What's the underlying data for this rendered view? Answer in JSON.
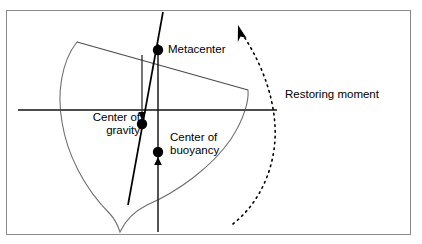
{
  "figure": {
    "frame": {
      "stroke": "#808080"
    },
    "colors": {
      "outline": "#6e6e6e",
      "line": "#000000",
      "waterline": "#4d4d4d",
      "dot": "#000000",
      "dashed_arc": "#000000",
      "text": "#000000",
      "background": "#ffffff"
    },
    "labels": {
      "metacenter": "Metacenter",
      "center_of_gravity_line1": "Center of",
      "center_of_gravity_line2": "gravity",
      "center_of_buoyancy_line1": "Center of",
      "center_of_buoyancy_line2": "buoyancy",
      "restoring_moment": "Restoring moment"
    },
    "points": [
      {
        "name": "metacenter",
        "x": 158,
        "y": 50,
        "r": 5.2
      },
      {
        "name": "center-of-gravity",
        "x": 142,
        "y": 124,
        "r": 5.2
      },
      {
        "name": "center-of-buoyancy",
        "x": 158,
        "y": 152,
        "r": 5.2
      }
    ],
    "geometry": {
      "frame": {
        "x": 6,
        "y": 10,
        "width": 405,
        "height": 225
      },
      "waterline": {
        "x1": 18,
        "y1": 110,
        "x2": 277,
        "y2": 110
      },
      "deck_line": {
        "x1": 77,
        "y1": 42,
        "x2": 248,
        "y2": 90
      },
      "hull_path": "M 77 42 C 62 60 58 92 62 120 C 66 152 82 186 110 214 C 116 220 118 226 120 232 C 124 222 132 212 146 206 C 176 194 210 170 230 140 C 244 118 249 100 248 90",
      "vertical_axis_buoyancy": {
        "x1": 158,
        "y1": 44,
        "x2": 158,
        "y2": 232
      },
      "vertical_axis_short": {
        "x1": 142,
        "y1": 55,
        "x2": 142,
        "y2": 126
      },
      "tilted_axis": {
        "x1": 163,
        "y1": 12,
        "x2": 128,
        "y2": 205
      },
      "arrow_up_buoyancy": {
        "x": 158,
        "y": 160
      },
      "arrow_down_gravity": {
        "x": 142,
        "y": 116
      },
      "dashed_arc": "M 233 224 C 262 200 276 162 274 124 C 272 88 258 56 240 30",
      "dashed_arc_arrowhead": {
        "x": 240,
        "y": 30
      }
    }
  }
}
